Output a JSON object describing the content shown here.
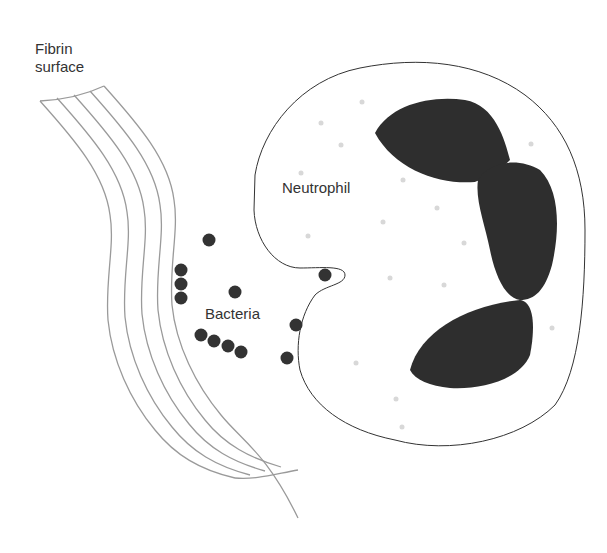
{
  "labels": {
    "fibrin_line1": "Fibrin",
    "fibrin_line2": "surface",
    "neutrophil": "Neutrophil",
    "bacteria": "Bacteria"
  },
  "colors": {
    "fibrin_stroke": "#9a9a9a",
    "cell_outline": "#333333",
    "nucleus_fill": "#2e2e2e",
    "bacteria_fill": "#333333",
    "granule_fill": "#d8d8d8",
    "text": "#333333"
  }
}
